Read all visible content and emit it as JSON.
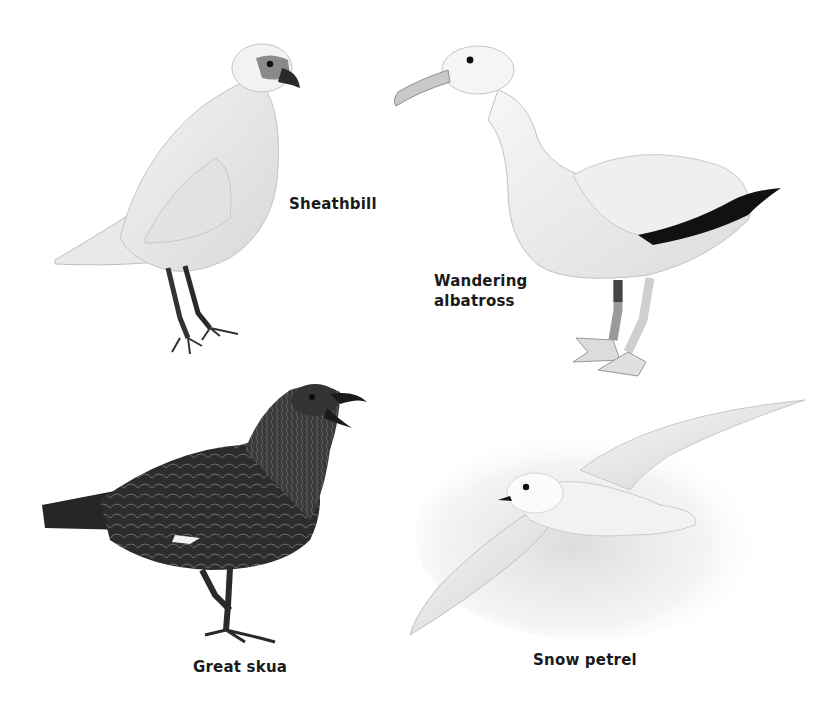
{
  "plate": {
    "background": "#ffffff",
    "birds": [
      {
        "id": "sheathbill",
        "label_lines": [
          "Sheathbill"
        ],
        "plumage": "white",
        "accent": "#3a3a3a"
      },
      {
        "id": "wandering-albatross",
        "label_lines": [
          "Wandering",
          "albatross"
        ],
        "plumage": "white",
        "accent": "#111111"
      },
      {
        "id": "great-skua",
        "label_lines": [
          "Great skua"
        ],
        "plumage": "dark brown",
        "accent": "#2b2b2b"
      },
      {
        "id": "snow-petrel",
        "label_lines": [
          "Snow petrel"
        ],
        "plumage": "white",
        "accent": "#dcdcdc"
      }
    ]
  }
}
